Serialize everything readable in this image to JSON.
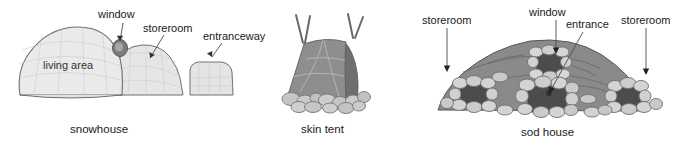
{
  "figure": {
    "background_color": "#ffffff",
    "panels": [
      {
        "id": "snowhouse",
        "caption": "snowhouse",
        "inner_labels": [
          {
            "name": "living-area",
            "text": "living area"
          }
        ],
        "callouts": [
          {
            "name": "window",
            "text": "window"
          },
          {
            "name": "storeroom",
            "text": "storeroom"
          },
          {
            "name": "entranceway",
            "text": "entranceway"
          }
        ],
        "colors": {
          "dome_fill": "#e9e9e9",
          "dome_shade": "#d8d8d8",
          "outline": "#6e6e6e",
          "window_fill": "#7c7c7c",
          "grid": "#c9c9c9"
        }
      },
      {
        "id": "skin-tent",
        "caption": "skin tent",
        "inner_labels": [],
        "callouts": [],
        "colors": {
          "hide_fill": "#8e8e8e",
          "hide_shade": "#6f6f6f",
          "pole": "#6a6a6a",
          "stone_fill": "#c6c6c6",
          "stone_outline": "#767676"
        }
      },
      {
        "id": "sod-house",
        "caption": "sod house",
        "inner_labels": [],
        "callouts": [
          {
            "name": "storeroom-left",
            "text": "storeroom"
          },
          {
            "name": "window",
            "text": "window"
          },
          {
            "name": "entrance",
            "text": "entrance"
          },
          {
            "name": "storeroom-right",
            "text": "storeroom"
          }
        ],
        "colors": {
          "sod_fill": "#8a8a8a",
          "sod_shade": "#6d6d6d",
          "opening_fill": "#4c4c4c",
          "stone_fill": "#d4d4d4",
          "stone_outline": "#6f6f6f"
        }
      }
    ]
  }
}
